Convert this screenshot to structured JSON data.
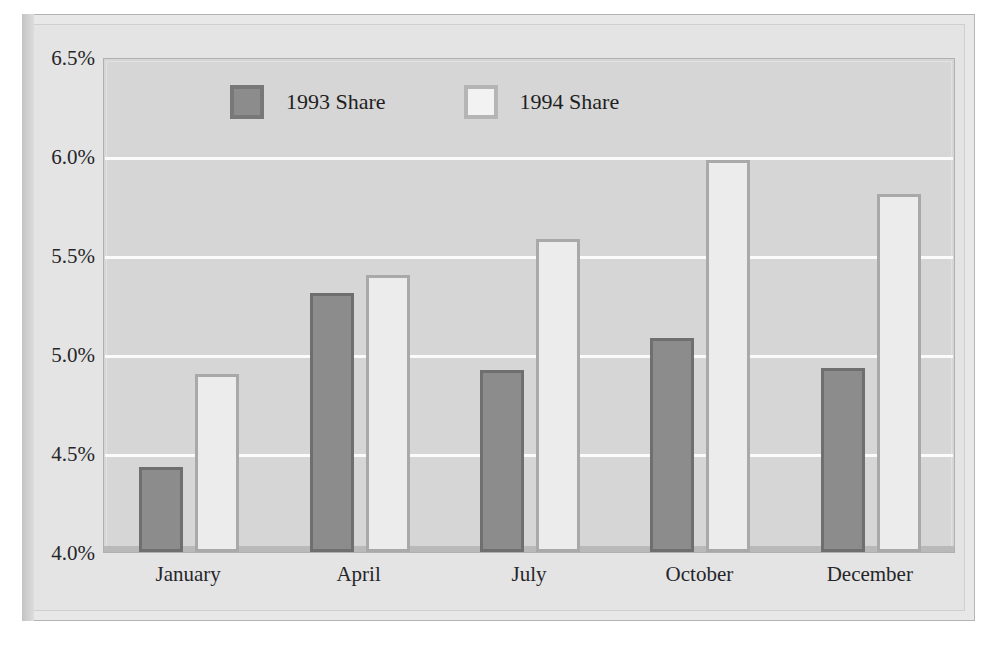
{
  "figure": {
    "background_color": "#e8e8e8",
    "plot_background_color": "#d6d6d6",
    "gridline_color": "#fbfbfb"
  },
  "legend": {
    "position": "top-left-inside",
    "entries": [
      {
        "label": "1993 Share",
        "color": "#8c8c8c",
        "border_color": "#6f6f6f",
        "swatch": "filled-square-dark"
      },
      {
        "label": "1994 Share",
        "color": "#ececec",
        "border_color": "#a9a9a9",
        "swatch": "filled-square-light"
      }
    ]
  },
  "chart_data": {
    "type": "bar",
    "title": "",
    "subtitle": "",
    "xlabel": "",
    "ylabel": "",
    "categories": [
      "January",
      "April",
      "July",
      "October",
      "December"
    ],
    "series": [
      {
        "name": "1993 Share",
        "values": [
          4.43,
          5.31,
          4.92,
          5.08,
          4.93
        ],
        "color": "#8c8c8c"
      },
      {
        "name": "1994 Share",
        "values": [
          4.9,
          5.4,
          5.58,
          5.98,
          5.81
        ],
        "color": "#ececec"
      }
    ],
    "ylim": [
      4.0,
      6.5
    ],
    "ytick_values": [
      4.0,
      4.5,
      5.0,
      5.5,
      6.0,
      6.5
    ],
    "ytick_labels": [
      "4.0%",
      "4.5%",
      "5.0%",
      "5.5%",
      "6.0%",
      "6.5%"
    ],
    "value_format": "percent",
    "grid": true,
    "grid_axis": "y",
    "legend_position": "upper left"
  }
}
